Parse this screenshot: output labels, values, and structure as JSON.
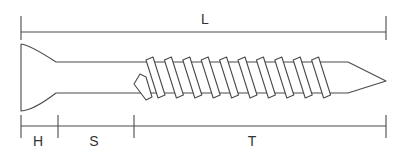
{
  "diagram": {
    "line_color": "#4a4a4a",
    "labels": {
      "L": "L",
      "H": "H",
      "S": "S",
      "T": "T"
    },
    "dimensions": [
      {
        "id": "L",
        "label": "L",
        "from_x": 21,
        "to_x": 386,
        "line_y": 32
      },
      {
        "id": "H",
        "label": "H",
        "from_x": 21,
        "to_x": 58,
        "line_y": 126
      },
      {
        "id": "S",
        "label": "S",
        "from_x": 58,
        "to_x": 134,
        "line_y": 126
      },
      {
        "id": "T",
        "label": "T",
        "from_x": 134,
        "to_x": 386,
        "line_y": 126
      }
    ],
    "thread": {
      "count": 10,
      "start_x": 146,
      "pitch": 18.4,
      "crest_top_y": 57,
      "crest_bottom_y": 98
    }
  }
}
